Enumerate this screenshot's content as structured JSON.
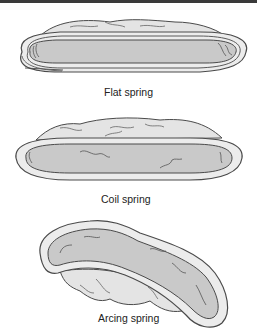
{
  "diagram": {
    "colors": {
      "outline": "#4a4a4a",
      "outer_fill": "#ececec",
      "inner_fill": "#c9c9c9",
      "top_lobe_fill": "#e2e2e2",
      "rule": "#3a3a3a"
    },
    "figures": [
      {
        "id": "flat",
        "caption": "Flat spring"
      },
      {
        "id": "coil",
        "caption": "Coil spring"
      },
      {
        "id": "arcing",
        "caption": "Arcing spring"
      }
    ]
  }
}
